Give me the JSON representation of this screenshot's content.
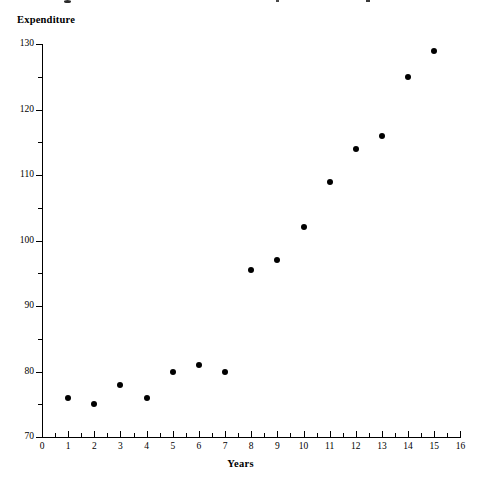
{
  "chart_data": {
    "type": "scatter",
    "title": "",
    "xlabel": "Years",
    "ylabel": "Expenditure",
    "xlim": [
      0,
      16
    ],
    "ylim": [
      70,
      130
    ],
    "grid": false,
    "legend": null,
    "x": [
      1,
      2,
      3,
      4,
      5,
      6,
      7,
      8,
      9,
      10,
      11,
      12,
      13,
      14,
      15
    ],
    "values": [
      76,
      75,
      78,
      76,
      80,
      81,
      80,
      95.5,
      97,
      102,
      109,
      114,
      116,
      125,
      129
    ],
    "points": [
      {
        "x": 1,
        "y": 76
      },
      {
        "x": 2,
        "y": 75
      },
      {
        "x": 3,
        "y": 78
      },
      {
        "x": 4,
        "y": 76
      },
      {
        "x": 5,
        "y": 80
      },
      {
        "x": 6,
        "y": 81
      },
      {
        "x": 7,
        "y": 80
      },
      {
        "x": 8,
        "y": 95.5
      },
      {
        "x": 9,
        "y": 97
      },
      {
        "x": 10,
        "y": 102
      },
      {
        "x": 11,
        "y": 109
      },
      {
        "x": 12,
        "y": 114
      },
      {
        "x": 13,
        "y": 116
      },
      {
        "x": 14,
        "y": 125
      },
      {
        "x": 15,
        "y": 129
      }
    ],
    "x_ticks": [
      0,
      1,
      2,
      3,
      4,
      5,
      6,
      7,
      8,
      9,
      10,
      11,
      12,
      13,
      14,
      15,
      16
    ],
    "x_tick_labels": [
      "0",
      "1",
      "2",
      "3",
      "4",
      "5",
      "6",
      "7",
      "8",
      "9",
      "10",
      "11",
      "12",
      "13",
      "14",
      "15",
      "16"
    ],
    "x_minor_step": 0.5,
    "y_ticks": [
      70,
      80,
      90,
      100,
      110,
      120,
      130
    ],
    "y_tick_labels": [
      "70",
      "80",
      "90",
      "100",
      "110",
      "120",
      "130"
    ],
    "y_minor_step": 5,
    "marker": "filled-circle",
    "marker_color": "#000000",
    "axis_color": "#000000",
    "background_color": "#ffffff"
  },
  "axes": {
    "y_title": "Expenditure",
    "x_title": "Years"
  }
}
